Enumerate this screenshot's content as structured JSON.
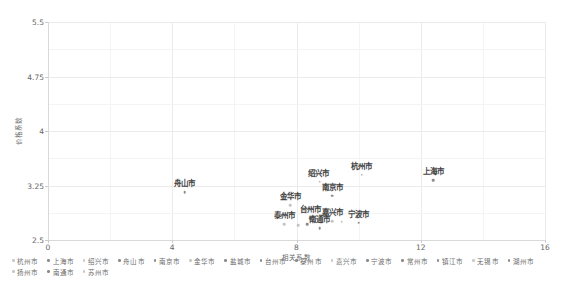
{
  "chart_data": {
    "type": "scatter",
    "title": "",
    "xlabel": "相关系数",
    "ylabel": "价格系数",
    "xlim": [
      0,
      16
    ],
    "ylim": [
      2.5,
      5.5
    ],
    "xticks": [
      "0",
      "4",
      "8",
      "12",
      "16"
    ],
    "xtick_values": [
      0,
      4,
      8,
      12,
      16
    ],
    "yticks": [
      "2.5",
      "3.25",
      "4",
      "4.75",
      "5.5"
    ],
    "ytick_values": [
      2.5,
      3.25,
      4,
      4.75,
      5.5
    ],
    "grid": true,
    "legend_position": "bottom",
    "points": [
      {
        "name": "舟山市",
        "x": 4.4,
        "y": 3.16,
        "shade": "dark",
        "label_dx": 0,
        "label_dy": -4
      },
      {
        "name": "金华市",
        "x": 7.8,
        "y": 2.98,
        "shade": "light",
        "label_dx": 0,
        "label_dy": -4
      },
      {
        "name": "泰州市",
        "x": 7.6,
        "y": 2.72,
        "shade": "light",
        "label_dx": 0,
        "label_dy": -4
      },
      {
        "name": "扬州市",
        "x": 8.05,
        "y": 2.7,
        "shade": "light",
        "label_dx": 0,
        "label_dy": 0
      },
      {
        "name": "盐城市",
        "x": 8.35,
        "y": 2.72,
        "shade": "dark",
        "label_dx": 0,
        "label_dy": 0
      },
      {
        "name": "台州市",
        "x": 8.45,
        "y": 2.8,
        "shade": "dark",
        "label_dx": 0,
        "label_dy": -4
      },
      {
        "name": "南通市",
        "x": 8.75,
        "y": 2.66,
        "shade": "dark",
        "label_dx": 0,
        "label_dy": -4
      },
      {
        "name": "绍兴市",
        "x": 8.75,
        "y": 3.3,
        "shade": "light",
        "label_dx": -1,
        "label_dy": -4
      },
      {
        "name": "南京市",
        "x": 9.15,
        "y": 3.11,
        "shade": "dark",
        "label_dx": 0,
        "label_dy": -4
      },
      {
        "name": "嘉兴市",
        "x": 9.15,
        "y": 2.76,
        "shade": "light",
        "label_dx": 0,
        "label_dy": -4
      },
      {
        "name": "湖州市",
        "x": 9.45,
        "y": 2.75,
        "shade": "light",
        "label_dx": 0,
        "label_dy": 0
      },
      {
        "name": "宁波市",
        "x": 10.0,
        "y": 2.74,
        "shade": "dark",
        "label_dx": 0,
        "label_dy": -4
      },
      {
        "name": "杭州市",
        "x": 10.1,
        "y": 3.4,
        "shade": "light",
        "label_dx": 0,
        "label_dy": -4
      },
      {
        "name": "上海市",
        "x": 12.4,
        "y": 3.32,
        "shade": "dark",
        "label_dx": 0,
        "label_dy": -4
      }
    ],
    "legend": [
      {
        "label": "杭州市",
        "shade": "light"
      },
      {
        "label": "上海市",
        "shade": "dark"
      },
      {
        "label": "绍兴市",
        "shade": "light"
      },
      {
        "label": "舟山市",
        "shade": "dark"
      },
      {
        "label": "南京市",
        "shade": "dark"
      },
      {
        "label": "金华市",
        "shade": "light"
      },
      {
        "label": "盐城市",
        "shade": "dark"
      },
      {
        "label": "台州市",
        "shade": "dark"
      },
      {
        "label": "泰州市",
        "shade": "dark"
      },
      {
        "label": "嘉兴市",
        "shade": "light"
      },
      {
        "label": "宁波市",
        "shade": "dark"
      },
      {
        "label": "常州市",
        "shade": "dark"
      },
      {
        "label": "镇江市",
        "shade": "dark"
      },
      {
        "label": "无锡市",
        "shade": "light"
      },
      {
        "label": "湖州市",
        "shade": "dark"
      },
      {
        "label": "扬州市",
        "shade": "light"
      },
      {
        "label": "南通市",
        "shade": "dark"
      },
      {
        "label": "苏州市",
        "shade": "light"
      }
    ]
  },
  "colors": {
    "marker_dark": "#8c8c8c",
    "marker_light": "#c4c4c4",
    "gridline": "#ebebeb",
    "axis": "#d9d9d9",
    "text": "#6b6b6b",
    "label_text": "#3f3f3f",
    "background": "#ffffff"
  }
}
